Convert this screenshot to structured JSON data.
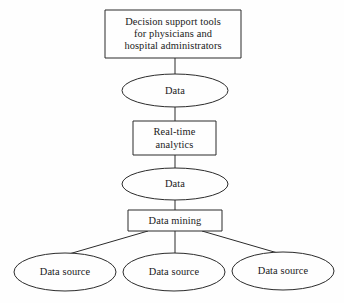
{
  "diagram": {
    "type": "flowchart",
    "orientation": "top-down",
    "background_color": "#fefefe",
    "stroke_color": "#2b2b2b",
    "text_color": "#1a1a1a",
    "nodes": [
      {
        "id": "decision-support-tools",
        "shape": "rectangle",
        "label": "Decision support tools\nfor physicians and\nhospital administrators",
        "level": 1
      },
      {
        "id": "data-upper",
        "shape": "ellipse",
        "label": "Data",
        "level": 2
      },
      {
        "id": "real-time-analytics",
        "shape": "rectangle",
        "label": "Real-time\nanalytics",
        "level": 3
      },
      {
        "id": "data-lower",
        "shape": "ellipse",
        "label": "Data",
        "level": 4
      },
      {
        "id": "data-mining",
        "shape": "rectangle",
        "label": "Data mining",
        "level": 5
      },
      {
        "id": "data-source-left",
        "shape": "ellipse",
        "label": "Data source",
        "level": 6
      },
      {
        "id": "data-source-center",
        "shape": "ellipse",
        "label": "Data source",
        "level": 6
      },
      {
        "id": "data-source-right",
        "shape": "ellipse",
        "label": "Data source",
        "level": 6
      }
    ],
    "edges": [
      {
        "from": "decision-support-tools",
        "to": "data-upper",
        "style": "straight"
      },
      {
        "from": "data-upper",
        "to": "real-time-analytics",
        "style": "straight"
      },
      {
        "from": "real-time-analytics",
        "to": "data-lower",
        "style": "straight"
      },
      {
        "from": "data-lower",
        "to": "data-mining",
        "style": "straight"
      },
      {
        "from": "data-mining",
        "to": "data-source-left",
        "style": "diagonal"
      },
      {
        "from": "data-mining",
        "to": "data-source-center",
        "style": "straight"
      },
      {
        "from": "data-mining",
        "to": "data-source-right",
        "style": "diagonal"
      }
    ]
  }
}
